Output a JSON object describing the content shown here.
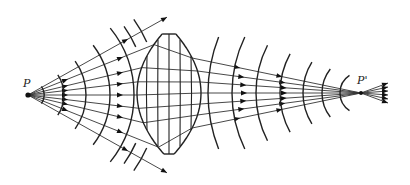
{
  "figure": {
    "source_label": "P",
    "image_label": "P'",
    "colors": {
      "ink": "#222222",
      "background": "#ffffff"
    }
  },
  "geometry": {
    "source": [
      28,
      95
    ],
    "image": [
      361,
      93
    ],
    "lens": {
      "left": 137,
      "right": 201,
      "top": 34,
      "bottom": 154,
      "cx": 169,
      "flat_half_width": 6
    },
    "lens_grid_x": [
      147,
      158,
      169,
      180,
      191
    ],
    "lens_grid_y": [
      52,
      70,
      93,
      116,
      134
    ],
    "left_ray_slopes": [
      -0.56,
      -0.4,
      -0.24,
      -0.12,
      0,
      0.12,
      0.24,
      0.4,
      0.56
    ],
    "left_wavefront_radii": [
      16,
      36,
      58,
      82,
      106
    ],
    "right_ray_endpoint_y": [
      44,
      58,
      71,
      82,
      93,
      104,
      115,
      128,
      142
    ],
    "right_wavefront_x": [
      208,
      232,
      256,
      280,
      303,
      322,
      340
    ],
    "outgoing_ray_tips_y": [
      83,
      87,
      91,
      95,
      99,
      103
    ]
  }
}
